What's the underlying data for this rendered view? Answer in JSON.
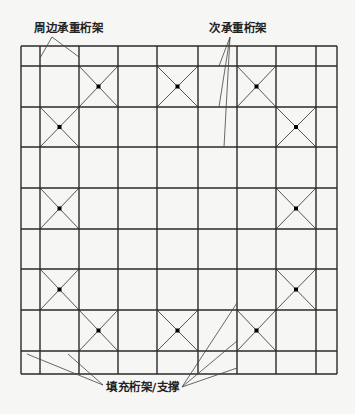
{
  "labels": {
    "perimeter": "周边承重桁架",
    "secondary": "次承重桁架",
    "infill": "填充桁架/支撑"
  },
  "grid": {
    "x": [
      21,
      40,
      79,
      118,
      157,
      198,
      237,
      276,
      316,
      337
    ],
    "y": [
      46,
      66,
      107,
      147,
      188,
      229,
      269,
      310,
      351,
      374
    ]
  },
  "braced_cells": [
    [
      2,
      1
    ],
    [
      4,
      1
    ],
    [
      6,
      1
    ],
    [
      1,
      2
    ],
    [
      7,
      2
    ],
    [
      1,
      4
    ],
    [
      7,
      4
    ],
    [
      1,
      6
    ],
    [
      7,
      6
    ],
    [
      2,
      7
    ],
    [
      4,
      7
    ],
    [
      6,
      7
    ]
  ],
  "leaders": {
    "perimeter": {
      "from": [
        52,
        37
      ],
      "to": [
        [
          40,
          58
        ],
        [
          79,
          57
        ]
      ]
    },
    "secondary": {
      "from": [
        230,
        37
      ],
      "to": [
        [
          219,
          66
        ],
        [
          219,
          107
        ],
        [
          224,
          147
        ]
      ]
    },
    "infill_left": {
      "from": [
        103,
        385
      ],
      "to": [
        [
          27,
          354
        ],
        [
          68,
          354
        ]
      ]
    },
    "infill_right": {
      "from": [
        182,
        387
      ],
      "to": [
        [
          237,
          303
        ],
        [
          237,
          341
        ],
        [
          237,
          368
        ]
      ]
    }
  },
  "colors": {
    "line": "#2a2a2a",
    "brace": "#555555",
    "node": "#000000"
  }
}
